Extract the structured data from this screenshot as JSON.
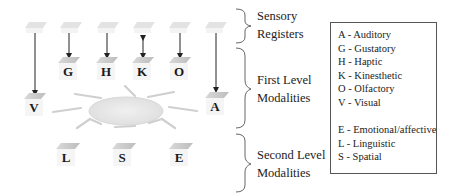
{
  "diagram": {
    "sensory_registers": 6,
    "first_level_nodes": [
      {
        "letter": "G",
        "arrow": "down"
      },
      {
        "letter": "H",
        "arrow": "down"
      },
      {
        "letter": "K",
        "arrow": "bidirectional"
      },
      {
        "letter": "O",
        "arrow": "down"
      },
      {
        "letter": "V",
        "arrow": "down"
      },
      {
        "letter": "A",
        "arrow": "down"
      }
    ],
    "second_level_nodes": [
      {
        "letter": "L"
      },
      {
        "letter": "S"
      },
      {
        "letter": "E"
      }
    ],
    "central_element": "sun-like ellipse with rays"
  },
  "brackets": {
    "sensory_line1": "Sensory",
    "sensory_line2": "Registers",
    "first_line1": "First Level",
    "first_line2": "Modalities",
    "second_line1": "Second Level",
    "second_line2": "Modalities"
  },
  "legend": {
    "items": [
      "A - Auditory",
      "G - Gustatory",
      "H - Haptic",
      "K - Kinesthetic",
      "O - Olfactory",
      "V - Visual",
      "E - Emotional/affective",
      "L - Linguistic",
      "S - Spatial"
    ]
  },
  "colors": {
    "platform": "#c8c8c8",
    "platform_light": "#e6e6e6",
    "arrow": "#222222",
    "sun": "#e4e4e4",
    "ray": "#d0d0d0",
    "brace": "#555555"
  }
}
